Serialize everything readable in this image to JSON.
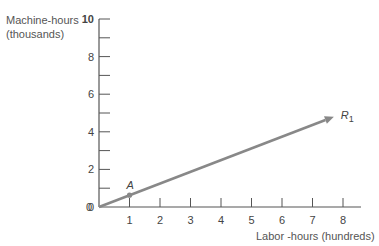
{
  "chart_data": {
    "type": "line",
    "title": "",
    "xlabel": "Labor -hours (hundreds)",
    "ylabel_line1": "Machine-hours",
    "ylabel_line2": "(thousands)",
    "xlim": [
      0,
      8.6
    ],
    "ylim": [
      0,
      10
    ],
    "x_ticks": [
      1,
      2,
      3,
      4,
      5,
      6,
      7,
      8
    ],
    "y_ticks_labeled": [
      0,
      2,
      4,
      6,
      8,
      10
    ],
    "y_ticks_minor": [
      1,
      3,
      5,
      7,
      9
    ],
    "grid": false,
    "series": [
      {
        "name": "R1",
        "label_main": "R",
        "label_sub": "1",
        "x": [
          0,
          7.7
        ],
        "y": [
          0,
          4.8
        ],
        "arrow": true,
        "color": "#888888"
      }
    ],
    "points": [
      {
        "name": "A",
        "x": 1,
        "y": 0.63
      }
    ],
    "origin_label": "0"
  }
}
